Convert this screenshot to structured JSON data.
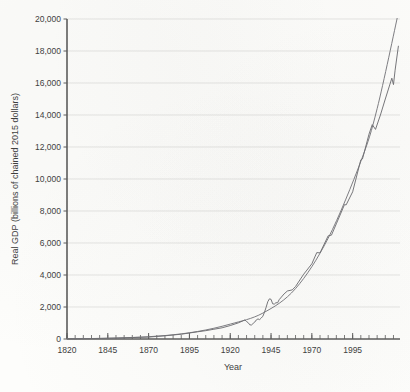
{
  "chart_data": {
    "type": "line",
    "title": "",
    "xlabel": "Year",
    "ylabel": "Real GDP (billions of chained 2015 dollars)",
    "xlim": [
      1820,
      2024
    ],
    "ylim": [
      0,
      20000
    ],
    "grid": true,
    "legend_position": "none",
    "x_major_ticks": [
      1820,
      1845,
      1870,
      1895,
      1920,
      1945,
      1970,
      1995
    ],
    "x_tick_labels": [
      "1820",
      "1845",
      "1870",
      "1895",
      "1920",
      "1945",
      "1970",
      "1995"
    ],
    "x_minor_tick_step": 5,
    "y_ticks": [
      0,
      2000,
      4000,
      6000,
      8000,
      10000,
      12000,
      14000,
      16000,
      18000,
      20000
    ],
    "y_tick_labels": [
      "0",
      "2,000",
      "4,000",
      "6,000",
      "8,000",
      "10,000",
      "12,000",
      "14,000",
      "16,000",
      "18,000",
      "20,000"
    ],
    "series": [
      {
        "name": "Real GDP (actual)",
        "color": "#6e6e72",
        "x": [
          1820,
          1830,
          1840,
          1850,
          1860,
          1870,
          1880,
          1890,
          1900,
          1905,
          1910,
          1915,
          1920,
          1925,
          1929,
          1930,
          1931,
          1932,
          1933,
          1934,
          1935,
          1936,
          1937,
          1938,
          1939,
          1940,
          1941,
          1942,
          1943,
          1944,
          1945,
          1946,
          1947,
          1948,
          1949,
          1950,
          1953,
          1955,
          1958,
          1960,
          1965,
          1970,
          1973,
          1975,
          1980,
          1982,
          1985,
          1990,
          1991,
          1995,
          2000,
          2001,
          2005,
          2007,
          2009,
          2012,
          2015,
          2019,
          2020,
          2021,
          2023
        ],
        "values": [
          12,
          20,
          34,
          56,
          90,
          120,
          200,
          300,
          450,
          520,
          610,
          700,
          840,
          1010,
          1190,
          1090,
          1020,
          885,
          875,
          970,
          1055,
          1195,
          1255,
          1210,
          1310,
          1425,
          1675,
          1990,
          2330,
          2510,
          2480,
          2200,
          2180,
          2270,
          2260,
          2460,
          2820,
          3000,
          3070,
          3280,
          4050,
          4700,
          5400,
          5380,
          6450,
          6490,
          7200,
          8400,
          8380,
          9200,
          11200,
          11250,
          12800,
          13400,
          13100,
          14000,
          15000,
          16300,
          15900,
          16800,
          18300
        ]
      },
      {
        "name": "Trend (exponential fit)",
        "color": "#75757a",
        "x": [
          1820,
          1840,
          1860,
          1880,
          1900,
          1920,
          1940,
          1960,
          1980,
          2000,
          2010,
          2023
        ],
        "values": [
          15,
          38,
          95,
          215,
          470,
          930,
          1620,
          3150,
          6300,
          11100,
          14400,
          20400
        ]
      }
    ],
    "notable_points": [
      {
        "year": 1933,
        "value": 875,
        "label": "Great Depression trough"
      },
      {
        "year": 1944,
        "value": 2510,
        "label": "WWII peak"
      },
      {
        "year": 2009,
        "value": 13100,
        "label": "Great Recession dip"
      },
      {
        "year": 2023,
        "value": 18300,
        "label": "Latest"
      }
    ]
  },
  "axes": {
    "y_title": "Real GDP (billions of chained 2015 dollars)",
    "x_title": "Year"
  }
}
